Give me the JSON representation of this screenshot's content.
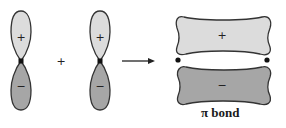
{
  "diagram": {
    "orbital_left": {
      "upper_sign": "+",
      "lower_sign": "−"
    },
    "operator": "+",
    "orbital_right": {
      "upper_sign": "+",
      "lower_sign": "−"
    },
    "arrow": "reaction-arrow",
    "pi_bond": {
      "upper_sign": "+",
      "lower_sign": "−",
      "label": "π bond"
    },
    "colors": {
      "positive_lobe": "#dcdcdc",
      "negative_lobe": "#a6a6a6",
      "outline": "#333333",
      "nucleus": "#111111"
    }
  }
}
